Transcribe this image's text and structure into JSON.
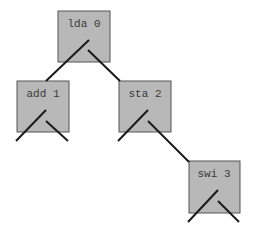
{
  "diagram": {
    "type": "binary-tree",
    "colors": {
      "node_fill": "#b8b8b8",
      "node_stroke": "#555555",
      "edge": "#1a1a1a",
      "text": "#3a3a3a"
    },
    "nodes": [
      {
        "id": "n0",
        "label": "lda 0",
        "x": 58,
        "y": 11,
        "w": 52,
        "h": 51
      },
      {
        "id": "n1",
        "label": "add 1",
        "x": 17,
        "y": 81,
        "w": 52,
        "h": 51
      },
      {
        "id": "n2",
        "label": "sta 2",
        "x": 119,
        "y": 81,
        "w": 52,
        "h": 51
      },
      {
        "id": "n3",
        "label": "swi 3",
        "x": 189,
        "y": 161,
        "w": 51,
        "h": 52
      }
    ],
    "edges": [
      {
        "from": "lda 0",
        "to": "add 1",
        "side": "left"
      },
      {
        "from": "lda 0",
        "to": "sta 2",
        "side": "right"
      },
      {
        "from": "add 1",
        "to": null,
        "side": "left"
      },
      {
        "from": "add 1",
        "to": null,
        "side": "right"
      },
      {
        "from": "sta 2",
        "to": null,
        "side": "left"
      },
      {
        "from": "sta 2",
        "to": "swi 3",
        "side": "right"
      },
      {
        "from": "swi 3",
        "to": null,
        "side": "left"
      },
      {
        "from": "swi 3",
        "to": null,
        "side": "right"
      }
    ]
  }
}
